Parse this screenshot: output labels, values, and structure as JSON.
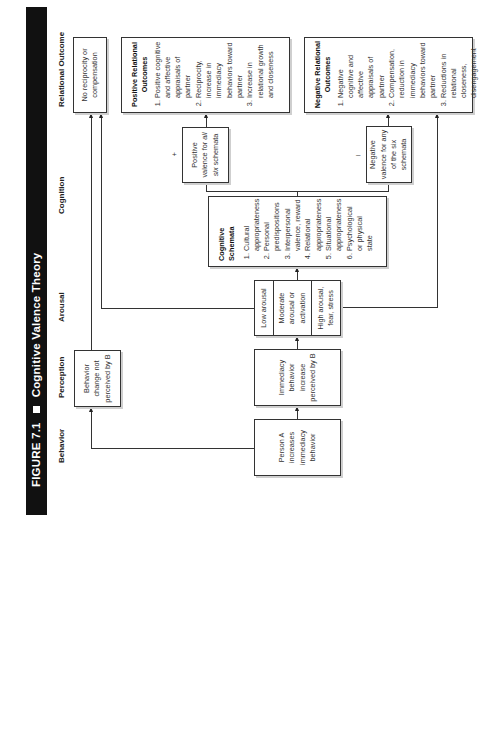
{
  "figure": {
    "number": "FIGURE 7.1",
    "title": "Cognitive Valence Theory"
  },
  "columns": {
    "behavior": "Behavior",
    "perception": "Perception",
    "arousal": "Arousal",
    "cognition": "Cognition",
    "relational_outcome": "Relational Outcome"
  },
  "nodes": {
    "person_a": {
      "text": "Person A increases immediacy behavior"
    },
    "not_perceived": {
      "text": "Behavior change not perceived by B"
    },
    "perceived": {
      "text": "Immediacy behavior increase perceived by B"
    },
    "arousal": {
      "low": "Low arousal",
      "moderate": "Moderate arousal or activation",
      "high": "High arousal, fear, stress"
    },
    "schemata": {
      "title": "Cognitive Schemata",
      "items": [
        "Cultural appropriateness",
        "Personal predispositions",
        "Interpersonal valence, reward",
        "Relational appropriateness",
        "Situational appropriateness",
        "Psychological or physical state"
      ]
    },
    "positive_valence": {
      "sign": "+",
      "text_1": "Positive valence for ",
      "emph": "all six",
      "text_2": " schemata"
    },
    "negative_valence": {
      "sign": "–",
      "text": "Negative valence for any of the six schemata"
    },
    "no_reciprocity": {
      "text": "No reciprocity or compensation"
    },
    "positive_outcomes": {
      "title": "Positive Relational Outcomes",
      "items": [
        "Positive cognitive and affective appraisals of partner",
        "Reciprocity, increase in immediacy behaviors toward partner",
        "Increase in relational growth and closeness"
      ]
    },
    "negative_outcomes": {
      "title": "Negative Relational Outcomes",
      "items": [
        "Negative cognitive and affective appraisals of partner",
        "Compensation, reduction in immediacy behaviors toward partner",
        "Reductions in relational closeness, disengagement"
      ]
    }
  }
}
